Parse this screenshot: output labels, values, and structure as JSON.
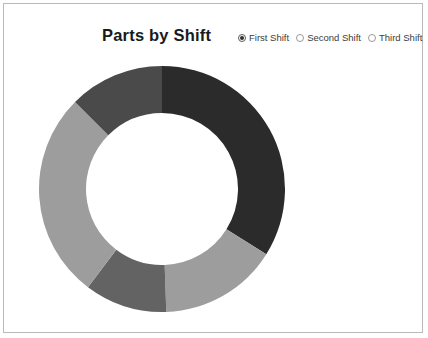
{
  "card": {
    "border_color": "#b9b9b9",
    "background": "#ffffff"
  },
  "header": {
    "title": "Parts by Shift"
  },
  "radio_group": {
    "name": "shift-selector",
    "options": [
      {
        "label": "First Shift",
        "selected": true
      },
      {
        "label": "Second Shift",
        "selected": false
      },
      {
        "label": "Third Shift",
        "selected": false
      }
    ]
  },
  "chart_data": {
    "type": "pie",
    "variant": "donut",
    "title": "Parts by Shift",
    "legend_position": "none",
    "grid": false,
    "center": {
      "x": 128,
      "y": 126
    },
    "outer_radius": 123,
    "inner_radius": 76,
    "start_angle_deg": 0,
    "direction": "clockwise",
    "total": 100,
    "categories": [
      "Segment 1",
      "Segment 2",
      "Segment 3",
      "Segment 4",
      "Segment 5"
    ],
    "values": [
      33.9,
      15.6,
      10.8,
      27.2,
      12.5
    ],
    "colors": [
      "#2b2b2b",
      "#9d9d9d",
      "#636363",
      "#9d9d9d",
      "#4a4a4a"
    ],
    "slices": [
      {
        "name": "Segment 1",
        "value": 33.9,
        "start_deg": 0,
        "end_deg": 122.0,
        "color": "#2b2b2b"
      },
      {
        "name": "Segment 2",
        "value": 15.6,
        "start_deg": 122.0,
        "end_deg": 178.0,
        "color": "#9d9d9d"
      },
      {
        "name": "Segment 3",
        "value": 10.8,
        "start_deg": 178.0,
        "end_deg": 217.0,
        "color": "#636363"
      },
      {
        "name": "Segment 4",
        "value": 27.2,
        "start_deg": 217.0,
        "end_deg": 315.0,
        "color": "#9d9d9d"
      },
      {
        "name": "Segment 5",
        "value": 12.5,
        "start_deg": 315.0,
        "end_deg": 360.0,
        "color": "#4a4a4a"
      }
    ],
    "xlabel": "",
    "ylabel": ""
  }
}
